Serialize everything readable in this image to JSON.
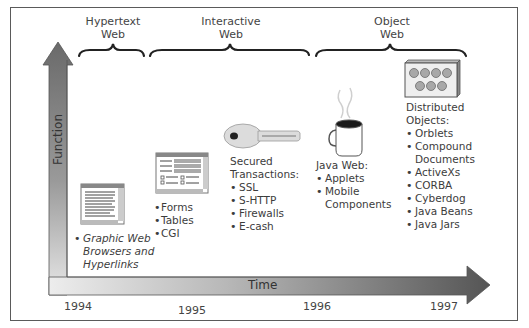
{
  "diagram": {
    "axes": {
      "y_label": "Function",
      "x_label": "Time",
      "x_ticks": [
        "1994",
        "1995",
        "1996",
        "1997"
      ]
    },
    "eras": [
      {
        "label_line1": "Hypertext",
        "label_line2": "Web"
      },
      {
        "label_line1": "Interactive",
        "label_line2": "Web"
      },
      {
        "label_line1": "Object",
        "label_line2": "Web"
      }
    ],
    "stages": [
      {
        "icon": "browser-window-icon",
        "items": [
          "Graphic Web",
          "Browsers and",
          "Hyperlinks"
        ]
      },
      {
        "icon": "form-window-icon",
        "items": [
          "Forms",
          "Tables",
          "CGI"
        ]
      },
      {
        "icon": "key-icon",
        "heading_line1": "Secured",
        "heading_line2": "Transactions:",
        "items": [
          "SSL",
          "S-HTTP",
          "Firewalls",
          "E-cash"
        ]
      },
      {
        "icon": "coffee-cup-icon",
        "heading": "Java Web:",
        "items": [
          "Applets",
          "Mobile",
          "Components"
        ]
      },
      {
        "icon": "distributed-objects-box-icon",
        "heading_line1": "Distributed",
        "heading_line2": "Objects:",
        "items": [
          "Orblets",
          "Compound",
          "Documents",
          "ActiveXs",
          "CORBA",
          "Cyberdog",
          "Java Beans",
          "Java Jars"
        ]
      }
    ],
    "colors": {
      "arrow_dark": "#5c5c5c",
      "arrow_light": "#e6e6e6",
      "border": "#5a5a5a",
      "text": "#3c3c3c"
    }
  }
}
